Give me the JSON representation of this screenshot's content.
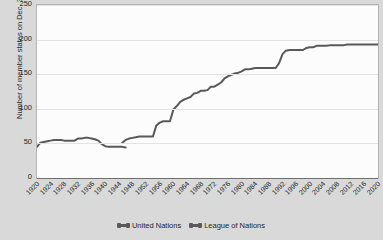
{
  "chart_data": {
    "type": "line",
    "title": "",
    "xlabel": "",
    "ylabel": "Number of member states on Dec. 31",
    "xlim": [
      1920,
      2020
    ],
    "ylim": [
      0,
      250
    ],
    "yticks": [
      0,
      50,
      100,
      150,
      200,
      250
    ],
    "xticks": [
      1920,
      1924,
      1928,
      1932,
      1936,
      1940,
      1944,
      1948,
      1952,
      1956,
      1960,
      1964,
      1968,
      1972,
      1976,
      1980,
      1984,
      1988,
      1992,
      1996,
      2000,
      2004,
      2008,
      2012,
      2016,
      2020
    ],
    "grid": true,
    "legend_position": "bottom-center",
    "line_color": "#595959",
    "series": [
      {
        "name": "League of Nations",
        "x": [
          1920,
          1921,
          1922,
          1923,
          1924,
          1925,
          1926,
          1927,
          1928,
          1929,
          1930,
          1931,
          1932,
          1933,
          1934,
          1935,
          1936,
          1937,
          1938,
          1939,
          1940,
          1941,
          1942,
          1943,
          1944,
          1945,
          1946
        ],
        "values": [
          45,
          51,
          52,
          53,
          54,
          55,
          55,
          55,
          54,
          54,
          54,
          54,
          57,
          57,
          58,
          58,
          57,
          56,
          54,
          49,
          46,
          45,
          45,
          45,
          45,
          45,
          44
        ]
      },
      {
        "name": "United Nations",
        "x": [
          1945,
          1946,
          1947,
          1948,
          1949,
          1950,
          1951,
          1952,
          1953,
          1954,
          1955,
          1956,
          1957,
          1958,
          1959,
          1960,
          1961,
          1962,
          1963,
          1964,
          1965,
          1966,
          1967,
          1968,
          1969,
          1970,
          1971,
          1972,
          1973,
          1974,
          1975,
          1976,
          1977,
          1978,
          1979,
          1980,
          1981,
          1982,
          1983,
          1984,
          1985,
          1986,
          1987,
          1988,
          1989,
          1990,
          1991,
          1992,
          1993,
          1994,
          1995,
          1996,
          1997,
          1998,
          1999,
          2000,
          2001,
          2002,
          2003,
          2004,
          2005,
          2006,
          2007,
          2008,
          2009,
          2010,
          2011,
          2012,
          2013,
          2014,
          2015,
          2016,
          2017,
          2018,
          2019,
          2020
        ],
        "values": [
          51,
          55,
          57,
          58,
          59,
          60,
          60,
          60,
          60,
          60,
          76,
          80,
          82,
          82,
          82,
          99,
          104,
          110,
          113,
          115,
          117,
          122,
          123,
          126,
          126,
          127,
          132,
          132,
          135,
          138,
          144,
          147,
          149,
          151,
          152,
          154,
          157,
          157,
          158,
          159,
          159,
          159,
          159,
          159,
          159,
          159,
          166,
          179,
          184,
          185,
          185,
          185,
          185,
          185,
          188,
          189,
          189,
          191,
          191,
          191,
          191,
          192,
          192,
          192,
          192,
          192,
          193,
          193,
          193,
          193,
          193,
          193,
          193,
          193,
          193,
          193
        ]
      }
    ],
    "legend": [
      {
        "label": "United Nations"
      },
      {
        "label": "League of Nations"
      }
    ]
  },
  "axis": {
    "y_title": "Number of member states on Dec. 31"
  }
}
